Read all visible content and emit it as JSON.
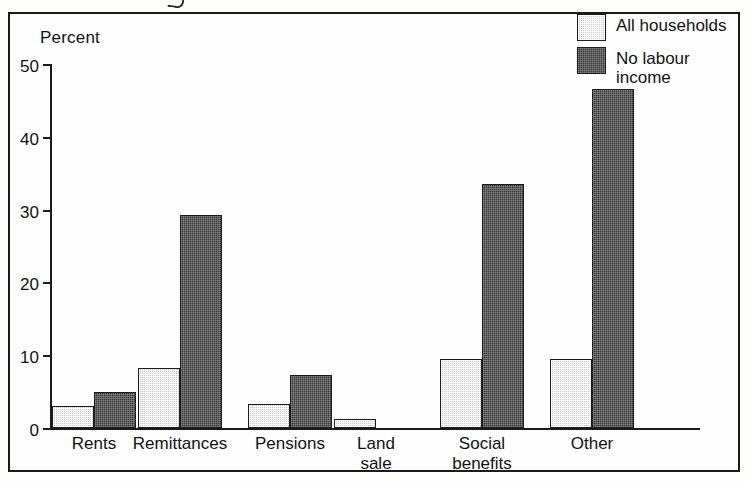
{
  "chart_data": {
    "type": "bar",
    "title": "",
    "xlabel": "",
    "ylabel": "Percent",
    "ylim": [
      0,
      50
    ],
    "yticks": [
      0,
      10,
      20,
      30,
      40,
      50
    ],
    "grid": false,
    "legend_position": "top-right",
    "categories": [
      "Rents",
      "Remittances",
      "Pensions",
      "Land\nsale",
      "Social\nbenefits",
      "Other"
    ],
    "series": [
      {
        "name": "All households",
        "color": "#cfcfcf",
        "values": [
          3.0,
          8.2,
          3.3,
          1.3,
          9.5,
          9.5
        ]
      },
      {
        "name": "No labour\nincome",
        "color": "#3a3a3a",
        "values": [
          5.0,
          29.3,
          7.3,
          0.0,
          33.5,
          46.5
        ]
      }
    ]
  },
  "legend": {
    "items": [
      {
        "label": "All households",
        "swatch": "light"
      },
      {
        "label": "No labour\nincome",
        "swatch": "dark"
      }
    ]
  }
}
